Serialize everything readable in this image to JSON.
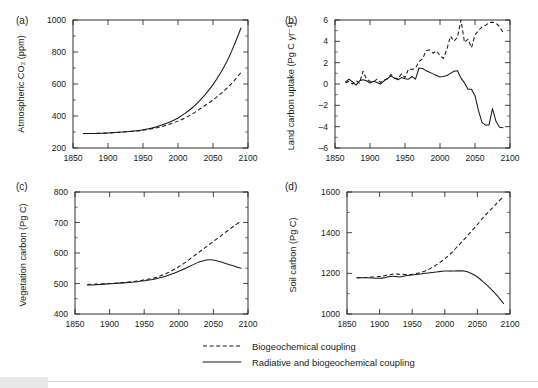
{
  "figure": {
    "panel_labels": [
      "(a)",
      "(b)",
      "(c)",
      "(d)"
    ],
    "legend": [
      {
        "style": "dashed",
        "label": "Biogeochemical coupling"
      },
      {
        "style": "solid",
        "label": "Radiative and biogeochemical coupling"
      }
    ]
  },
  "chart_data": [
    {
      "panel": "(a)",
      "type": "line",
      "title": "",
      "xlabel": "",
      "ylabel": "Atmospheric CO₂ (ppm)",
      "xlim": [
        1850,
        2100
      ],
      "ylim": [
        200,
        1000
      ],
      "xticks": [
        1850,
        1900,
        1950,
        2000,
        2050,
        2100
      ],
      "xtick_labels": [
        "1850",
        "1900",
        "1950",
        "2000",
        "2050",
        "2100"
      ],
      "yticks": [
        200,
        400,
        600,
        800,
        1000
      ],
      "ytick_labels": [
        "200",
        "400",
        "600",
        "800",
        "1000"
      ],
      "yticks_minor": [
        300,
        500,
        700,
        900
      ],
      "grid": false,
      "legend_position": "below-figure",
      "series": [
        {
          "name": "Radiative and biogeochemical coupling",
          "style": "solid",
          "x": [
            1865,
            1880,
            1900,
            1920,
            1940,
            1950,
            1960,
            1970,
            1980,
            1990,
            2000,
            2010,
            2020,
            2030,
            2040,
            2050,
            2060,
            2070,
            2080,
            2090
          ],
          "y": [
            290,
            291,
            294,
            300,
            308,
            314,
            322,
            334,
            348,
            366,
            388,
            416,
            450,
            492,
            540,
            596,
            664,
            742,
            840,
            950
          ]
        },
        {
          "name": "Biogeochemical coupling",
          "style": "dashed",
          "x": [
            1865,
            1880,
            1900,
            1920,
            1940,
            1950,
            1960,
            1970,
            1980,
            1990,
            2000,
            2010,
            2020,
            2030,
            2040,
            2050,
            2060,
            2070,
            2080,
            2090
          ],
          "y": [
            290,
            291,
            294,
            299,
            306,
            311,
            318,
            327,
            338,
            352,
            368,
            388,
            412,
            440,
            470,
            500,
            536,
            574,
            620,
            672
          ]
        }
      ]
    },
    {
      "panel": "(b)",
      "type": "line",
      "title": "",
      "xlabel": "",
      "ylabel": "Land carbon uptake (Pg C yr⁻¹)",
      "xlim": [
        1850,
        2100
      ],
      "ylim": [
        -6,
        6
      ],
      "xticks": [
        1850,
        1900,
        1950,
        2000,
        2050,
        2100
      ],
      "xtick_labels": [
        "1850",
        "1900",
        "1950",
        "2000",
        "2050",
        "2100"
      ],
      "yticks": [
        -6,
        -4,
        -2,
        0,
        2,
        4,
        6
      ],
      "ytick_labels": [
        "–6",
        "–4",
        "–2",
        "0",
        "2",
        "4",
        "6"
      ],
      "yticks_minor": [
        -5,
        -3,
        -1,
        1,
        3,
        5
      ],
      "grid": false,
      "legend_position": "below-figure",
      "series": [
        {
          "name": "Radiative and biogeochemical coupling",
          "style": "solid",
          "x": [
            1865,
            1870,
            1875,
            1880,
            1885,
            1890,
            1895,
            1900,
            1905,
            1910,
            1915,
            1920,
            1925,
            1930,
            1935,
            1940,
            1945,
            1950,
            1955,
            1960,
            1965,
            1970,
            1975,
            1980,
            1985,
            1990,
            1995,
            2000,
            2005,
            2010,
            2015,
            2020,
            2025,
            2030,
            2035,
            2040,
            2045,
            2050,
            2055,
            2060,
            2065,
            2070,
            2075,
            2080,
            2085,
            2090
          ],
          "y": [
            0.2,
            0.45,
            0.2,
            -0.1,
            0.3,
            0.4,
            0.3,
            0.1,
            0.25,
            0.15,
            0.0,
            0.3,
            0.5,
            0.75,
            0.55,
            0.4,
            0.6,
            0.5,
            0.45,
            0.7,
            0.45,
            1.5,
            1.45,
            1.25,
            1.1,
            0.95,
            0.8,
            0.65,
            0.7,
            0.8,
            1.0,
            1.2,
            1.25,
            0.55,
            0.1,
            -0.5,
            -0.5,
            -1.1,
            -2.5,
            -3.6,
            -3.85,
            -3.85,
            -2.3,
            -3.5,
            -4.05,
            -4.1
          ]
        },
        {
          "name": "Biogeochemical coupling",
          "style": "dashed",
          "x": [
            1865,
            1870,
            1875,
            1880,
            1885,
            1890,
            1895,
            1900,
            1905,
            1910,
            1915,
            1920,
            1925,
            1930,
            1935,
            1940,
            1945,
            1950,
            1955,
            1960,
            1965,
            1970,
            1975,
            1980,
            1985,
            1990,
            1995,
            2000,
            2005,
            2010,
            2015,
            2020,
            2025,
            2030,
            2035,
            2040,
            2045,
            2050,
            2055,
            2060,
            2065,
            2070,
            2075,
            2080,
            2085,
            2090
          ],
          "y": [
            0.1,
            0.25,
            0.0,
            0.3,
            0.1,
            1.2,
            0.45,
            0.25,
            0.2,
            0.45,
            0.15,
            0.35,
            0.5,
            0.9,
            0.55,
            0.5,
            0.95,
            0.6,
            1.4,
            1.35,
            1.5,
            2.1,
            2.35,
            3.1,
            3.2,
            2.9,
            3.1,
            2.65,
            2.4,
            3.3,
            4.5,
            4.0,
            4.4,
            6.0,
            3.9,
            4.2,
            3.4,
            4.6,
            5.0,
            5.35,
            5.5,
            5.75,
            5.8,
            5.7,
            5.4,
            4.85
          ]
        }
      ]
    },
    {
      "panel": "(c)",
      "type": "line",
      "title": "",
      "xlabel": "",
      "ylabel": "Vegetation carbon (Pg C)",
      "xlim": [
        1850,
        2100
      ],
      "ylim": [
        400,
        800
      ],
      "xticks": [
        1850,
        1900,
        1950,
        2000,
        2050,
        2100
      ],
      "xtick_labels": [
        "1850",
        "1900",
        "1950",
        "2000",
        "2050",
        "2100"
      ],
      "yticks": [
        400,
        500,
        600,
        700,
        800
      ],
      "ytick_labels": [
        "400",
        "500",
        "600",
        "700",
        "800"
      ],
      "yticks_minor": [
        450,
        550,
        650,
        750
      ],
      "grid": false,
      "legend_position": "below-figure",
      "series": [
        {
          "name": "Radiative and biogeochemical coupling",
          "style": "solid",
          "x": [
            1868,
            1880,
            1900,
            1920,
            1940,
            1950,
            1960,
            1970,
            1980,
            1990,
            2000,
            2010,
            2020,
            2030,
            2040,
            2045,
            2050,
            2060,
            2070,
            2080,
            2090
          ],
          "y": [
            495,
            496,
            499,
            502,
            506,
            509,
            512,
            517,
            523,
            531,
            540,
            550,
            561,
            571,
            577,
            578,
            577,
            571,
            564,
            557,
            550
          ]
        },
        {
          "name": "Biogeochemical coupling",
          "style": "dashed",
          "x": [
            1868,
            1880,
            1900,
            1920,
            1940,
            1950,
            1960,
            1970,
            1980,
            1990,
            2000,
            2010,
            2020,
            2030,
            2040,
            2050,
            2060,
            2070,
            2080,
            2090
          ],
          "y": [
            497,
            498,
            500,
            503,
            508,
            512,
            516,
            522,
            531,
            542,
            555,
            570,
            587,
            604,
            621,
            638,
            655,
            672,
            689,
            705
          ]
        }
      ]
    },
    {
      "panel": "(d)",
      "type": "line",
      "title": "",
      "xlabel": "",
      "ylabel": "Soil carbon (Pg C)",
      "xlim": [
        1850,
        2100
      ],
      "ylim": [
        1000,
        1600
      ],
      "xticks": [
        1850,
        1900,
        1950,
        2000,
        2050,
        2100
      ],
      "xtick_labels": [
        "1850",
        "1900",
        "1950",
        "2000",
        "2050",
        "2100"
      ],
      "yticks": [
        1000,
        1200,
        1400,
        1600
      ],
      "ytick_labels": [
        "1000",
        "1200",
        "1400",
        "1600"
      ],
      "yticks_minor": [
        1100,
        1300,
        1500
      ],
      "grid": false,
      "legend_position": "below-figure",
      "series": [
        {
          "name": "Radiative and biogeochemical coupling",
          "style": "solid",
          "x": [
            1865,
            1880,
            1900,
            1910,
            1920,
            1930,
            1940,
            1950,
            1960,
            1970,
            1980,
            1990,
            2000,
            2010,
            2020,
            2030,
            2040,
            2050,
            2060,
            2070,
            2080,
            2090
          ],
          "y": [
            1178,
            1178,
            1176,
            1180,
            1186,
            1182,
            1188,
            1192,
            1196,
            1200,
            1204,
            1208,
            1211,
            1211,
            1212,
            1211,
            1200,
            1182,
            1155,
            1125,
            1092,
            1052
          ]
        },
        {
          "name": "Biogeochemical coupling",
          "style": "dashed",
          "x": [
            1865,
            1880,
            1900,
            1910,
            1920,
            1930,
            1940,
            1950,
            1960,
            1970,
            1980,
            1990,
            2000,
            2010,
            2020,
            2030,
            2040,
            2050,
            2060,
            2070,
            2080,
            2090
          ],
          "y": [
            1178,
            1180,
            1184,
            1190,
            1196,
            1196,
            1194,
            1196,
            1202,
            1212,
            1228,
            1248,
            1272,
            1300,
            1334,
            1368,
            1404,
            1440,
            1478,
            1512,
            1545,
            1578
          ]
        }
      ]
    }
  ]
}
